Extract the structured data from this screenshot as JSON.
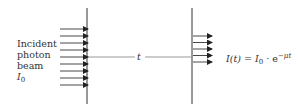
{
  "diagram": {
    "incident_label_lines": [
      "Incident",
      "photon",
      "beam"
    ],
    "incident_intensity_symbol": "I",
    "incident_intensity_subscript": "0",
    "thickness_label": "t",
    "equation": {
      "lhs": "I(t)",
      "equals": "=",
      "I0_symbol": "I",
      "I0_subscript": "0",
      "dot": "·",
      "base": "e",
      "exponent": "−μt"
    },
    "incident_arrow_count": 9,
    "transmitted_arrow_count": 5,
    "colors": {
      "line": "#333333",
      "thickness_line": "#999999",
      "text": "#333333"
    }
  }
}
